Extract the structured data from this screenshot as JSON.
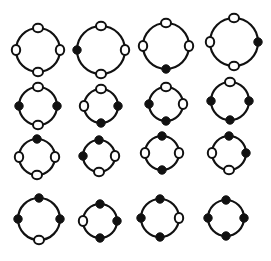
{
  "figure": {
    "ink_color": "#111111",
    "background": "#ffffff",
    "positions": [
      "top",
      "right",
      "bottom",
      "left"
    ]
  },
  "rings": [
    {
      "row": 0,
      "col": 0,
      "cx": 38,
      "cy": 50,
      "r": 22,
      "beads": {
        "top": "open",
        "right": "open",
        "bottom": "open",
        "left": "open"
      }
    },
    {
      "row": 0,
      "col": 1,
      "cx": 101,
      "cy": 50,
      "r": 24,
      "beads": {
        "top": "open",
        "right": "open",
        "bottom": "open",
        "left": "filled"
      }
    },
    {
      "row": 0,
      "col": 2,
      "cx": 166,
      "cy": 46,
      "r": 23,
      "beads": {
        "top": "open",
        "right": "open",
        "bottom": "filled",
        "left": "open"
      }
    },
    {
      "row": 0,
      "col": 3,
      "cx": 234,
      "cy": 42,
      "r": 24,
      "beads": {
        "top": "open",
        "right": "filled",
        "bottom": "open",
        "left": "open"
      }
    },
    {
      "row": 1,
      "col": 0,
      "cx": 38,
      "cy": 106,
      "r": 19,
      "beads": {
        "top": "open",
        "right": "filled",
        "bottom": "open",
        "left": "filled"
      }
    },
    {
      "row": 1,
      "col": 1,
      "cx": 101,
      "cy": 106,
      "r": 17,
      "beads": {
        "top": "open",
        "right": "filled",
        "bottom": "filled",
        "left": "open"
      }
    },
    {
      "row": 1,
      "col": 2,
      "cx": 166,
      "cy": 104,
      "r": 17,
      "beads": {
        "top": "open",
        "right": "open",
        "bottom": "filled",
        "left": "filled"
      }
    },
    {
      "row": 1,
      "col": 3,
      "cx": 230,
      "cy": 101,
      "r": 19,
      "beads": {
        "top": "open",
        "right": "filled",
        "bottom": "filled",
        "left": "filled"
      }
    },
    {
      "row": 2,
      "col": 0,
      "cx": 37,
      "cy": 157,
      "r": 18,
      "beads": {
        "top": "filled",
        "right": "open",
        "bottom": "open",
        "left": "open"
      }
    },
    {
      "row": 2,
      "col": 1,
      "cx": 99,
      "cy": 156,
      "r": 16,
      "beads": {
        "top": "filled",
        "right": "open",
        "bottom": "open",
        "left": "filled"
      }
    },
    {
      "row": 2,
      "col": 2,
      "cx": 162,
      "cy": 153,
      "r": 17,
      "beads": {
        "top": "filled",
        "right": "open",
        "bottom": "filled",
        "left": "open"
      }
    },
    {
      "row": 2,
      "col": 3,
      "cx": 229,
      "cy": 153,
      "r": 17,
      "beads": {
        "top": "filled",
        "right": "filled",
        "bottom": "open",
        "left": "open"
      }
    },
    {
      "row": 3,
      "col": 0,
      "cx": 39,
      "cy": 219,
      "r": 21,
      "beads": {
        "top": "filled",
        "right": "filled",
        "bottom": "open",
        "left": "filled"
      }
    },
    {
      "row": 3,
      "col": 1,
      "cx": 100,
      "cy": 221,
      "r": 17,
      "beads": {
        "top": "filled",
        "right": "filled",
        "bottom": "filled",
        "left": "open"
      }
    },
    {
      "row": 3,
      "col": 2,
      "cx": 160,
      "cy": 218,
      "r": 19,
      "beads": {
        "top": "filled",
        "right": "open",
        "bottom": "filled",
        "left": "filled"
      }
    },
    {
      "row": 3,
      "col": 3,
      "cx": 226,
      "cy": 218,
      "r": 18,
      "beads": {
        "top": "filled",
        "right": "filled",
        "bottom": "filled",
        "left": "filled"
      }
    }
  ]
}
